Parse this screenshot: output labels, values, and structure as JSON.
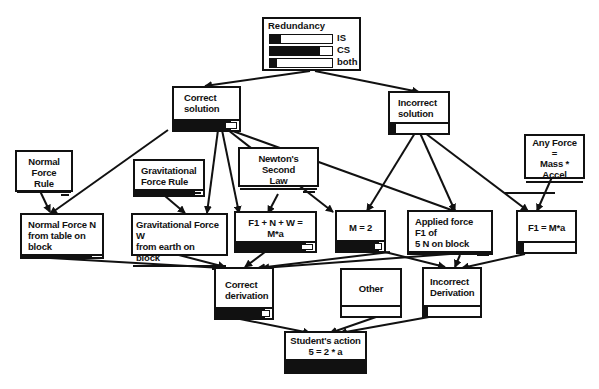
{
  "legend": {
    "title": "Redundancy",
    "rows": [
      {
        "label": "IS",
        "fill_pct": 18
      },
      {
        "label": "CS",
        "fill_pct": 80
      },
      {
        "label": "both",
        "fill_pct": 12
      }
    ]
  },
  "nodes": {
    "correct_solution": {
      "label": "Correct\nsolution",
      "fill_pct": 88
    },
    "incorrect_solution": {
      "label": "Incorrect\nsolution",
      "fill_pct": 10
    },
    "normal_force_rule": {
      "label": "Normal Force\nRule",
      "fill_pct": 88
    },
    "gravitational_force_rule": {
      "label": "Gravitational\nForce Rule",
      "fill_pct": 88
    },
    "newtons_second_law": {
      "label": "Newton's Second\nLaw",
      "fill_pct": 88
    },
    "any_force": {
      "label": "Any Force\n=\nMass * Accel",
      "fill_pct": 10
    },
    "normal_force_n": {
      "label": "Normal Force N\nfrom table on block",
      "fill_pct": 88
    },
    "gravitational_force_w": {
      "label": "Gravitational Force W\nfrom earth on block",
      "fill_pct": 88
    },
    "f1_n_w": {
      "label": "F1 + N + W = M*a",
      "fill_pct": 88
    },
    "m_equals_2": {
      "label": "M = 2",
      "fill_pct": 88
    },
    "applied_force_f1": {
      "label": "Applied force F1 of\n5 N on block",
      "fill_pct": 88
    },
    "f1_ma": {
      "label": "F1 = M*a",
      "fill_pct": 10
    },
    "correct_derivation": {
      "label": "Correct\nderivation",
      "fill_pct": 88
    },
    "other": {
      "label": "Other",
      "fill_pct": 0
    },
    "incorrect_derivation": {
      "label": "Incorrect\nDerivation",
      "fill_pct": 8
    },
    "students_action": {
      "label": "Student's action\n5 = 2 * a",
      "fill_pct": 100
    }
  },
  "edges": [
    [
      "redundancy",
      "correct_solution"
    ],
    [
      "redundancy",
      "incorrect_solution"
    ],
    [
      "correct_solution",
      "normal_force_n"
    ],
    [
      "correct_solution",
      "gravitational_force_w"
    ],
    [
      "correct_solution",
      "f1_n_w"
    ],
    [
      "correct_solution",
      "m_equals_2"
    ],
    [
      "correct_solution",
      "applied_force_f1"
    ],
    [
      "incorrect_solution",
      "m_equals_2"
    ],
    [
      "incorrect_solution",
      "applied_force_f1"
    ],
    [
      "incorrect_solution",
      "f1_ma"
    ],
    [
      "normal_force_rule",
      "normal_force_n"
    ],
    [
      "gravitational_force_rule",
      "gravitational_force_w"
    ],
    [
      "newtons_second_law",
      "f1_n_w"
    ],
    [
      "any_force",
      "f1_ma"
    ],
    [
      "normal_force_n",
      "correct_derivation"
    ],
    [
      "gravitational_force_w",
      "correct_derivation"
    ],
    [
      "f1_n_w",
      "correct_derivation"
    ],
    [
      "m_equals_2",
      "correct_derivation"
    ],
    [
      "applied_force_f1",
      "correct_derivation"
    ],
    [
      "m_equals_2",
      "incorrect_derivation"
    ],
    [
      "applied_force_f1",
      "incorrect_derivation"
    ],
    [
      "f1_ma",
      "incorrect_derivation"
    ],
    [
      "correct_derivation",
      "students_action"
    ],
    [
      "other",
      "students_action"
    ],
    [
      "incorrect_derivation",
      "students_action"
    ]
  ]
}
